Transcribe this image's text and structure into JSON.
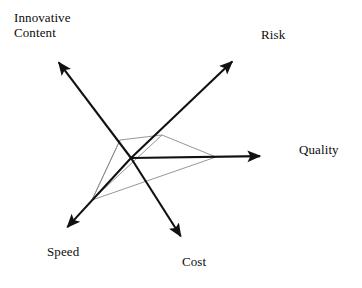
{
  "figure": {
    "title": "",
    "type": "radar-diagram",
    "background_color": "#ffffff",
    "axis_color": "#111111",
    "polygon_color": "#8a8a8a",
    "label_color": "#0d0d0d",
    "center": {
      "x": 131,
      "y": 158
    }
  },
  "chart_data": {
    "type": "radar",
    "title": "",
    "xlabel": "",
    "ylabel": "",
    "grid": false,
    "legend": "none",
    "axes": [
      {
        "label": "Innovative Content",
        "label_lines": "Innovative\nContent",
        "angle_deg": 126,
        "arrow_tip": {
          "x": 54,
          "y": 56
        },
        "value": 0.22,
        "point": {
          "x": 120,
          "y": 140
        }
      },
      {
        "label": "Risk",
        "label_lines": "Risk",
        "angle_deg": 43,
        "arrow_tip": {
          "x": 238,
          "y": 56
        },
        "value": 0.29,
        "point": {
          "x": 162,
          "y": 135
        }
      },
      {
        "label": "Quality",
        "label_lines": "Quality",
        "angle_deg": 1,
        "arrow_tip": {
          "x": 268,
          "y": 156
        },
        "value": 0.62,
        "point": {
          "x": 216,
          "y": 157
        }
      },
      {
        "label": "Cost",
        "label_lines": "Cost",
        "angle_deg": -61,
        "arrow_tip": {
          "x": 185,
          "y": 243
        },
        "value": 0.0,
        "point": {
          "x": 131,
          "y": 158
        }
      },
      {
        "label": "Speed",
        "label_lines": "Speed",
        "angle_deg": -136,
        "arrow_tip": {
          "x": 62,
          "y": 233
        },
        "value": 0.53,
        "point": {
          "x": 92,
          "y": 200
        }
      }
    ],
    "series": [
      {
        "name": "profile",
        "values": [
          0.22,
          0.29,
          0.62,
          0.0,
          0.53
        ],
        "polygon_points": "120,140 162,135 216,157 92,200"
      }
    ],
    "categories": [
      "Innovative Content",
      "Risk",
      "Quality",
      "Cost",
      "Speed"
    ]
  },
  "labels": {
    "innovative_content": "Innovative\nContent",
    "risk": "Risk",
    "quality": "Quality",
    "cost": "Cost",
    "speed": "Speed"
  }
}
